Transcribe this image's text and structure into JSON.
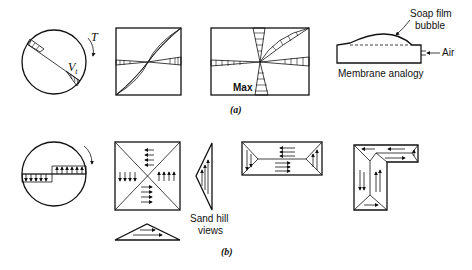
{
  "figure": {
    "part_a": {
      "caption": "(a)",
      "circle": {
        "torque_label": "T",
        "stress_label": "V",
        "stress_subscript": "t"
      },
      "rect_max_label": "Max",
      "membrane": {
        "bubble_label_line1": "Soap film",
        "bubble_label_line2": "bubble",
        "air_label": "Air",
        "title": "Membrane analogy"
      }
    },
    "part_b": {
      "caption": "(b)",
      "sand_hill_label_line1": "Sand hill",
      "sand_hill_label_line2": "views"
    }
  },
  "colors": {
    "ink": "#111111",
    "background": "#ffffff"
  }
}
